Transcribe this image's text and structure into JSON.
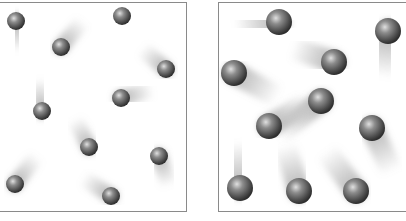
{
  "figure": {
    "panels": [
      {
        "id": "left",
        "ball_radius": 9,
        "caption": "(cut off at bottom edge)",
        "balls": [
          {
            "x": 16,
            "y": 21,
            "trail_dx": 2,
            "trail_dy": 30
          },
          {
            "x": 61,
            "y": 47,
            "trail_dx": 22,
            "trail_dy": -26
          },
          {
            "x": 122,
            "y": 16,
            "trail_dx": 34,
            "trail_dy": 0
          },
          {
            "x": 166,
            "y": 69,
            "trail_dx": -24,
            "trail_dy": -20
          },
          {
            "x": 42,
            "y": 111,
            "trail_dx": -4,
            "trail_dy": -32
          },
          {
            "x": 121,
            "y": 98,
            "trail_dx": 32,
            "trail_dy": -8
          },
          {
            "x": 89,
            "y": 147,
            "trail_dx": -14,
            "trail_dy": -28
          },
          {
            "x": 159,
            "y": 156,
            "trail_dx": 10,
            "trail_dy": 30
          },
          {
            "x": 15,
            "y": 184,
            "trail_dx": 22,
            "trail_dy": -28
          },
          {
            "x": 111,
            "y": 196,
            "trail_dx": -28,
            "trail_dy": -18
          }
        ]
      },
      {
        "id": "right",
        "ball_radius": 13,
        "caption": "(cut off at bottom edge)",
        "balls": [
          {
            "x": 279,
            "y": 22,
            "trail_dx": -44,
            "trail_dy": 4
          },
          {
            "x": 388,
            "y": 31,
            "trail_dx": -6,
            "trail_dy": 46
          },
          {
            "x": 334,
            "y": 62,
            "trail_dx": -42,
            "trail_dy": -14
          },
          {
            "x": 234,
            "y": 73,
            "trail_dx": 44,
            "trail_dy": 24
          },
          {
            "x": 321,
            "y": 101,
            "trail_dx": -44,
            "trail_dy": 34
          },
          {
            "x": 269,
            "y": 126,
            "trail_dx": 40,
            "trail_dy": -24
          },
          {
            "x": 372,
            "y": 128,
            "trail_dx": 20,
            "trail_dy": 44
          },
          {
            "x": 240,
            "y": 188,
            "trail_dx": -4,
            "trail_dy": -46
          },
          {
            "x": 299,
            "y": 191,
            "trail_dx": -14,
            "trail_dy": -46
          },
          {
            "x": 356,
            "y": 191,
            "trail_dx": -30,
            "trail_dy": -40
          }
        ]
      }
    ],
    "colors": {
      "border": "#8a8a8a",
      "ball_highlight": "#d8d8d8",
      "ball_mid": "#7a7a7a",
      "ball_dark": "#3a3a3a",
      "trail": "#9a9a9a"
    }
  }
}
